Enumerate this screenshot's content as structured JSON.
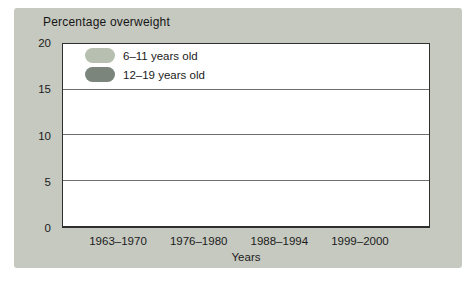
{
  "figure": {
    "panel_color": "#c6c9c0",
    "plot_background": "#ffffff",
    "axis_color": "#2f2f2f",
    "gridline_color": "#6e6e6e",
    "text_color": "#1b1b1b",
    "bar_shadow_color": "rgba(0,0,0,0.16)"
  },
  "chart_data": {
    "type": "bar",
    "title": "Percentage overweight",
    "xlabel": "Years",
    "ylabel": "",
    "categories": [
      "1963–1970",
      "1976–1980",
      "1988–1994",
      "1999–2000"
    ],
    "series": [
      {
        "name": "6–11 years old",
        "color": "#b7c0b0",
        "values": [
          4.2,
          7.1,
          11.1,
          15.2
        ]
      },
      {
        "name": "12–19 years old",
        "color": "#7b857b",
        "values": [
          5.1,
          5.0,
          11.2,
          15.5
        ]
      }
    ],
    "ylim": [
      0,
      20
    ],
    "yticks": [
      0,
      5,
      10,
      15,
      20
    ],
    "gridlines": [
      5,
      10,
      15
    ],
    "grid": "on",
    "legend_position": "top-left"
  }
}
